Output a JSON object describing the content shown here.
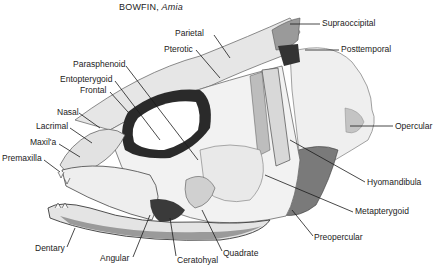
{
  "figure": {
    "title": "BOWFIN,",
    "title_italic": "Amia"
  },
  "labels": [
    {
      "id": "parietal",
      "text": "Parietal",
      "x": 175,
      "y": 28
    },
    {
      "id": "supraoccipital",
      "text": "Supraoccipital",
      "x": 322,
      "y": 18
    },
    {
      "id": "pterotic",
      "text": "Pterotic",
      "x": 164,
      "y": 44
    },
    {
      "id": "posttemporal",
      "text": "Posttemporal",
      "x": 341,
      "y": 44
    },
    {
      "id": "parasphenoid",
      "text": "Parasphenoid",
      "x": 73,
      "y": 59
    },
    {
      "id": "entopterygoid",
      "text": "Entopterygoid",
      "x": 60,
      "y": 74
    },
    {
      "id": "frontal",
      "text": "Frontal",
      "x": 80,
      "y": 85
    },
    {
      "id": "nasal",
      "text": "Nasal",
      "x": 57,
      "y": 107
    },
    {
      "id": "lacrimal",
      "text": "Lacrimal",
      "x": 36,
      "y": 121
    },
    {
      "id": "maxilla",
      "text": "Maxil'a",
      "x": 30,
      "y": 137
    },
    {
      "id": "premaxilla",
      "text": "Premaxilla",
      "x": 2,
      "y": 153
    },
    {
      "id": "opercular",
      "text": "Opercular",
      "x": 395,
      "y": 121
    },
    {
      "id": "hyomandibula",
      "text": "Hyomandibula",
      "x": 367,
      "y": 177
    },
    {
      "id": "metapterygoid",
      "text": "Metapterygoid",
      "x": 355,
      "y": 206
    },
    {
      "id": "preopercular",
      "text": "Preopercular",
      "x": 314,
      "y": 232
    },
    {
      "id": "dentary",
      "text": "Dentary",
      "x": 35,
      "y": 243
    },
    {
      "id": "angular",
      "text": "Angular",
      "x": 100,
      "y": 253
    },
    {
      "id": "ceratohyal",
      "text": "Ceratohyal",
      "x": 177,
      "y": 255
    },
    {
      "id": "quadrate",
      "text": "Quadrate",
      "x": 223,
      "y": 248
    }
  ],
  "leader_lines": [
    {
      "id": "parietal",
      "x1": 214,
      "y1": 35,
      "x2": 230,
      "y2": 58
    },
    {
      "id": "supraoccipital",
      "x1": 320,
      "y1": 24,
      "x2": 290,
      "y2": 24
    },
    {
      "id": "pterotic",
      "x1": 196,
      "y1": 50,
      "x2": 220,
      "y2": 78
    },
    {
      "id": "posttemporal",
      "x1": 339,
      "y1": 50,
      "x2": 305,
      "y2": 50
    },
    {
      "id": "parasphenoid",
      "x1": 126,
      "y1": 66,
      "x2": 198,
      "y2": 160
    },
    {
      "id": "entopterygoid",
      "x1": 115,
      "y1": 81,
      "x2": 160,
      "y2": 140
    },
    {
      "id": "frontal",
      "x1": 110,
      "y1": 92,
      "x2": 128,
      "y2": 112
    },
    {
      "id": "nasal",
      "x1": 79,
      "y1": 113,
      "x2": 100,
      "y2": 128
    },
    {
      "id": "lacrimal",
      "x1": 70,
      "y1": 128,
      "x2": 92,
      "y2": 143
    },
    {
      "id": "maxilla",
      "x1": 59,
      "y1": 144,
      "x2": 80,
      "y2": 157
    },
    {
      "id": "premaxilla",
      "x1": 44,
      "y1": 160,
      "x2": 60,
      "y2": 172
    },
    {
      "id": "opercular",
      "x1": 393,
      "y1": 126,
      "x2": 350,
      "y2": 126
    },
    {
      "id": "hyomandibula",
      "x1": 365,
      "y1": 182,
      "x2": 290,
      "y2": 140
    },
    {
      "id": "metapterygoid",
      "x1": 353,
      "y1": 212,
      "x2": 265,
      "y2": 175
    },
    {
      "id": "preopercular",
      "x1": 313,
      "y1": 236,
      "x2": 292,
      "y2": 210
    },
    {
      "id": "dentary",
      "x1": 67,
      "y1": 247,
      "x2": 75,
      "y2": 228
    },
    {
      "id": "angular",
      "x1": 133,
      "y1": 257,
      "x2": 150,
      "y2": 215
    },
    {
      "id": "ceratohyal",
      "x1": 176,
      "y1": 256,
      "x2": 170,
      "y2": 218
    },
    {
      "id": "quadrate",
      "x1": 222,
      "y1": 251,
      "x2": 202,
      "y2": 210
    }
  ],
  "colors": {
    "background": "#ffffff",
    "text": "#222222",
    "bone_light": "#eeeeee",
    "bone_mid": "#c8c8c8",
    "bone_dark": "#5a5a5a",
    "shadow": "#222222"
  }
}
